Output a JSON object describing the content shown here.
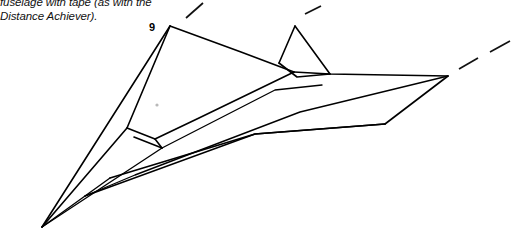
{
  "figure": {
    "caption_text": "fuselage with tape (as with the\nDistance Achiever).",
    "caption_lines": [
      "fuselage with tape (as with the",
      "Distance Achiever)."
    ],
    "figure_number_label": "9",
    "colors": {
      "line": "#000000",
      "background": "#ffffff",
      "caption_text": "#111111",
      "speck": "#b9b9b9"
    },
    "drawing": {
      "description": "Line drawing of a folded paper airplane seen in three-quarter perspective, nose pointing to the lower left, with a left wing panel, a central fuselage keel, a raised triangular fin, a swept right wing, and short dashed leader lines indicating motion or fold extensions.",
      "nose_point": "42,227",
      "left_wing_panel": "170,26 L 127,128 L 155,139 L 294,72",
      "wing_top_edge": "170,26 L 294,72 L 448,76",
      "fin_triangle": "295,26 L 330,74 L 279,63 Z",
      "fuselage_keel": "42,227 L 170,26",
      "body_lines": [
        "42,227 L 127,128",
        "42,227 L 322,85",
        "42,227 L 385,124",
        "85,196 L 448,76"
      ],
      "trailing_edge": "448,76 L 385,124 L 110,178",
      "wing_root_box": "127,128 L 155,139 L 162,148 L 134,137",
      "dashes": [
        "186,18 L 203,3",
        "305,14 L 321,6",
        "459,69 L 478,58",
        "490,52 L 510,41"
      ],
      "speck": {
        "x": 157,
        "y": 105,
        "r": 1.6
      }
    }
  }
}
